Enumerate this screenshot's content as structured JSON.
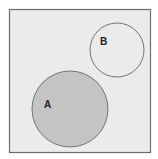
{
  "diagram": {
    "type": "venn",
    "universe": {
      "x": 9,
      "y": 9,
      "width": 141,
      "height": 143,
      "fill": "#ebebeb",
      "stroke": "#6e6e6e"
    },
    "sets": [
      {
        "id": "A",
        "label": "A",
        "shaded": true,
        "cx": 70,
        "cy": 109,
        "r": 38,
        "fill": "#c4c4c4",
        "stroke": "#737373",
        "label_x": 44,
        "label_y": 108
      },
      {
        "id": "B",
        "label": "B",
        "shaded": false,
        "cx": 117,
        "cy": 50,
        "r": 27,
        "fill": "#ebebeb",
        "stroke": "#737373",
        "label_x": 100,
        "label_y": 45
      }
    ],
    "relationship": "disjoint"
  }
}
